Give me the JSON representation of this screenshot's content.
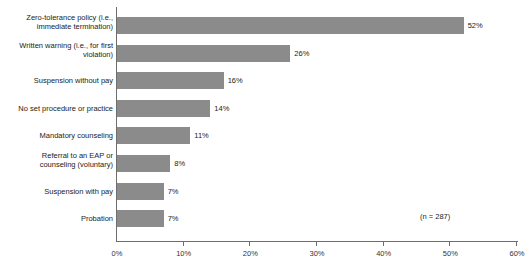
{
  "chart_data": {
    "type": "bar",
    "orientation": "horizontal",
    "title": "",
    "subtitle": "",
    "xlabel": "",
    "ylabel": "",
    "xlim": [
      0,
      60
    ],
    "xtick_step": 10,
    "grid": false,
    "legend": null,
    "value_suffix": "%",
    "bar_color": "#8b8b8b",
    "axis_color": "#6e6e6e",
    "text_color": "#222222",
    "background": "#ffffff",
    "annotation": "(n = 287)",
    "tick_labels": [
      "0%",
      "10%",
      "20%",
      "30%",
      "40%",
      "50%",
      "60%"
    ],
    "tick_values": [
      0,
      10,
      20,
      30,
      40,
      50,
      60
    ],
    "categories": [
      "Zero-tolerance policy (i.e.,\nimmediate termination)",
      "Written warning (i.e., for first\nviolation)",
      "Suspension without pay",
      "No set procedure or practice",
      "Mandatory counseling",
      "Referral to an EAP or\ncounseling (voluntary)",
      "Suspension with pay",
      "Probation"
    ],
    "values": [
      52,
      26,
      16,
      14,
      11,
      8,
      7,
      7
    ],
    "value_labels": [
      "52%",
      "26%",
      "16%",
      "14%",
      "11%",
      "8%",
      "7%",
      "7%"
    ]
  },
  "rows": [
    {
      "label": "Zero-tolerance policy (i.e.,\nimmediate termination)",
      "value": 52,
      "value_label": "52%",
      "lines": 2
    },
    {
      "label": "Written warning (i.e., for first\nviolation)",
      "value": 26,
      "value_label": "26%",
      "lines": 2
    },
    {
      "label": "Suspension without pay",
      "value": 16,
      "value_label": "16%",
      "lines": 1
    },
    {
      "label": "No set procedure or practice",
      "value": 14,
      "value_label": "14%",
      "lines": 1
    },
    {
      "label": "Mandatory counseling",
      "value": 11,
      "value_label": "11%",
      "lines": 1
    },
    {
      "label": "Referral to an EAP or\ncounseling (voluntary)",
      "value": 8,
      "value_label": "8%",
      "lines": 2
    },
    {
      "label": "Suspension with pay",
      "value": 7,
      "value_label": "7%",
      "lines": 1
    },
    {
      "label": "Probation",
      "value": 7,
      "value_label": "7%",
      "lines": 1
    }
  ],
  "axis": {
    "ticks": [
      {
        "label": "0%",
        "value": 0
      },
      {
        "label": "10%",
        "value": 10
      },
      {
        "label": "20%",
        "value": 20
      },
      {
        "label": "30%",
        "value": 30
      },
      {
        "label": "40%",
        "value": 40
      },
      {
        "label": "50%",
        "value": 50
      },
      {
        "label": "60%",
        "value": 60
      }
    ]
  },
  "annotation": {
    "text": "(n = 287)"
  }
}
